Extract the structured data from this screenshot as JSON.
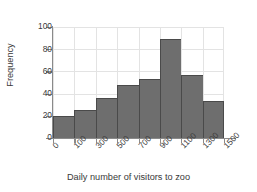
{
  "chart_data": {
    "type": "bar",
    "title": "",
    "subtitle": "",
    "xlabel": "Daily number of visitors to zoo",
    "ylabel": "Frequency",
    "categories": [
      "100-300",
      "300-500",
      "500-700",
      "700-900",
      "900-1100",
      "1100-1300",
      "1300-1500",
      "1500-1700"
    ],
    "bin_edges": [
      100,
      300,
      500,
      700,
      900,
      1100,
      1300,
      1500,
      1700
    ],
    "values": [
      20,
      25,
      36,
      48,
      53,
      89,
      57,
      33
    ],
    "xticks": [
      "0",
      "100",
      "300",
      "500",
      "700",
      "900",
      "1100",
      "1300",
      "1500"
    ],
    "yticks": [
      0,
      20,
      40,
      60,
      80,
      100
    ],
    "ylim": [
      0,
      100
    ],
    "xlim": [
      0,
      1700
    ],
    "grid": true,
    "legend": "none",
    "bar_color": "#6e6e6e",
    "bar_edge_color": "#4a4a4a",
    "grid_color": "#e3e3e3",
    "axis_color": "#8a8a8a",
    "background": "#ffffff"
  }
}
